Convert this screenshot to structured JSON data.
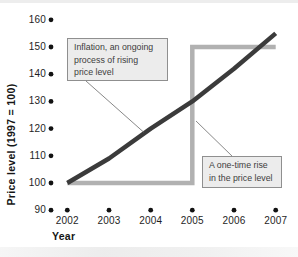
{
  "figure": {
    "background": "#ffffff",
    "tick_dot_color": "#121212",
    "pointer_line_color": "#7a7a7a",
    "callout_fill": "#ececec",
    "callout_border": "#8f8f8f"
  },
  "axes": {
    "y": {
      "title": "Price level (1997 = 100)",
      "ticks": [
        160,
        150,
        140,
        130,
        120,
        110,
        100,
        90
      ],
      "range": [
        90,
        160
      ]
    },
    "x": {
      "title": "Year",
      "ticks": [
        2002,
        2003,
        2004,
        2005,
        2006,
        2007
      ]
    }
  },
  "chart_data": {
    "type": "line",
    "x": [
      2002,
      2003,
      2004,
      2005,
      2006,
      2007
    ],
    "series": [
      {
        "name": "Inflation, an ongoing process of rising price level",
        "values": [
          100,
          109,
          120,
          130,
          142,
          155
        ],
        "color": "#3b3b3b",
        "stroke_width": 4.5,
        "style": "smooth"
      },
      {
        "name": "A one-time rise in the price level",
        "step_points": [
          [
            2002,
            100
          ],
          [
            2005,
            100
          ],
          [
            2005,
            150
          ],
          [
            2007,
            150
          ]
        ],
        "color": "#b1b1b1",
        "stroke_width": 4.5,
        "style": "step"
      }
    ],
    "title": "",
    "xlabel": "Year",
    "ylabel": "Price level (1997 = 100)",
    "xlim": [
      2002,
      2007
    ],
    "ylim": [
      90,
      160
    ],
    "y_tick_interval": 10,
    "grid": false,
    "legend_position": "none",
    "tick_style": "dots"
  },
  "annotations": [
    {
      "id": "inflation-note",
      "lines": [
        "Inflation, an ongoing",
        "process of rising",
        "price level"
      ],
      "points_to": "inflation curve"
    },
    {
      "id": "one-time-note",
      "lines": [
        "A one-time rise",
        "in the price level"
      ],
      "points_to": "step line jump at 2005"
    }
  ]
}
